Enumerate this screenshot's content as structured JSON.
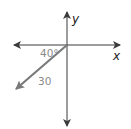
{
  "diagram": {
    "type": "vector-on-axes",
    "axes": {
      "x_label": "x",
      "y_label": "y"
    },
    "vector": {
      "magnitude_label": "30",
      "angle_label": "40°",
      "direction": "below negative x-axis (third quadrant)"
    },
    "colors": {
      "axes": "#3a3a3a",
      "vector": "#7a7a7a",
      "vector_labels": "#8a8a8a",
      "axis_labels": "#222222"
    }
  }
}
